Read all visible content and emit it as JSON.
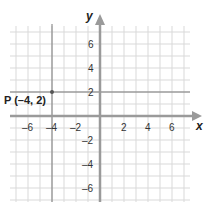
{
  "chart_data": {
    "type": "scatter",
    "title": "",
    "xlabel": "x",
    "ylabel": "y",
    "xlim": [
      -7.5,
      7.5
    ],
    "ylim": [
      -7.5,
      7.5
    ],
    "grid": true,
    "x_ticks": [
      "-6",
      "-4",
      "-2",
      "2",
      "4",
      "6"
    ],
    "y_ticks": [
      "6",
      "4",
      "2",
      "-2",
      "-4",
      "-6"
    ],
    "points": [
      {
        "label": "P (-4, 2)",
        "x": -4,
        "y": 2
      }
    ],
    "guide_lines": [
      {
        "type": "vertical",
        "x": -4
      },
      {
        "type": "horizontal",
        "y": 2
      }
    ]
  },
  "labels": {
    "x_axis": "x",
    "y_axis": "y",
    "point": "P (–4, 2)",
    "x_ticks": [
      "–6",
      "–4",
      "–2",
      "2",
      "4",
      "6"
    ],
    "y_ticks": [
      "6",
      "4",
      "2",
      "–2",
      "–4",
      "–6"
    ]
  },
  "colors": {
    "grid": "#d9d9d9",
    "axis": "#9a9a9a",
    "guide": "#7a7a7a",
    "point": "#555555"
  }
}
